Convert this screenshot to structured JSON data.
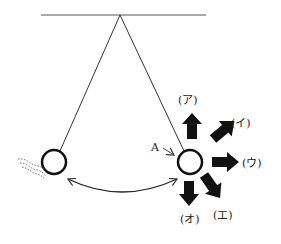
{
  "diagram": {
    "type": "pendulum",
    "colors": {
      "line": "#333333",
      "arrow": "#111111",
      "background": "#ffffff"
    },
    "point_label": "A",
    "arrows": [
      {
        "id": "a",
        "label": "(ア)",
        "direction": "up"
      },
      {
        "id": "i",
        "label": "(イ)",
        "direction": "up-right"
      },
      {
        "id": "u",
        "label": "(ウ)",
        "direction": "right"
      },
      {
        "id": "e",
        "label": "(エ)",
        "direction": "down-right"
      },
      {
        "id": "o",
        "label": "(オ)",
        "direction": "down"
      }
    ]
  }
}
